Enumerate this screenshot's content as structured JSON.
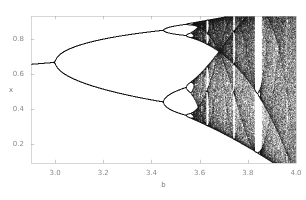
{
  "figure": {
    "width": 306,
    "height": 200,
    "background": "#ffffff",
    "point_color": "#1a1a1a",
    "frame_color": "#b0b0b0",
    "tick_color": "#9a9a9a",
    "label_color": "#808080"
  },
  "plot_area": {
    "left": 31,
    "top": 16,
    "right": 296,
    "bottom": 163
  },
  "chart_data": {
    "type": "scatter",
    "title": "",
    "subtitle": "",
    "xlabel": "b",
    "ylabel": "x",
    "xlim": [
      2.9,
      4.0
    ],
    "ylim": [
      0.09,
      0.93
    ],
    "xticks": [
      3.0,
      3.2,
      3.4,
      3.6,
      3.8,
      4.0
    ],
    "xtick_labels": [
      "3.0",
      "3.2",
      "3.4",
      "3.6",
      "3.8",
      "4.0"
    ],
    "yticks": [
      0.2,
      0.4,
      0.6,
      0.8
    ],
    "ytick_labels": [
      "0.2",
      "0.4",
      "0.6",
      "0.8"
    ],
    "grid": false,
    "legend": null,
    "legend_position": "none",
    "map": {
      "equation": "x_next = b * x * (1 - x)",
      "b_min": 2.9,
      "b_max": 4.0,
      "b_steps": 1060,
      "x_seed": 0.35,
      "transient_iterations": 320,
      "plot_iterations": 260
    },
    "annotations": [
      {
        "label": "period-1 fixed point",
        "b_range": [
          2.9,
          3.0
        ],
        "x_range": [
          0.655,
          0.667
        ]
      },
      {
        "label": "first period-doubling",
        "b": 3.0
      },
      {
        "label": "second period-doubling",
        "b": 3.449
      },
      {
        "label": "third period-doubling",
        "b": 3.544
      },
      {
        "label": "onset of chaos",
        "b": 3.5699
      },
      {
        "label": "period-3 window",
        "b": 3.8284
      },
      {
        "label": "period-5 window",
        "b": 3.7382
      },
      {
        "label": "period-6 window",
        "b": 3.6265
      }
    ]
  }
}
